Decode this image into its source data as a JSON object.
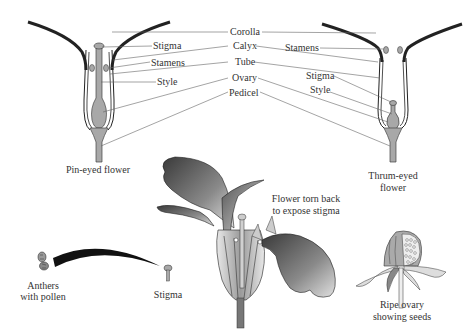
{
  "diagram": {
    "type": "botanical-illustration",
    "center_labels": [
      "Corolla",
      "Calyx",
      "Tube",
      "Ovary",
      "Pedicel"
    ],
    "pin_eyed": {
      "caption": "Pin-eyed flower",
      "labels": [
        "Stigma",
        "Stamens",
        "Style"
      ]
    },
    "thrum_eyed": {
      "caption_line1": "Thrum-eyed",
      "caption_line2": "flower",
      "labels": [
        "Stamens",
        "Stigma",
        "Style"
      ]
    },
    "torn_flower": {
      "caption_line1": "Flower torn back",
      "caption_line2": "to expose stigma"
    },
    "pollination": {
      "anthers_line1": "Anthers",
      "anthers_line2": "with pollen",
      "stigma": "Stigma"
    },
    "ripe_ovary": {
      "caption_line1": "Ripe ovary",
      "caption_line2": "showing seeds"
    },
    "colors": {
      "petal_dark": "#3a3a3a",
      "fill_gray": "#a8a8a8",
      "line": "#555555",
      "text": "#333333"
    }
  }
}
